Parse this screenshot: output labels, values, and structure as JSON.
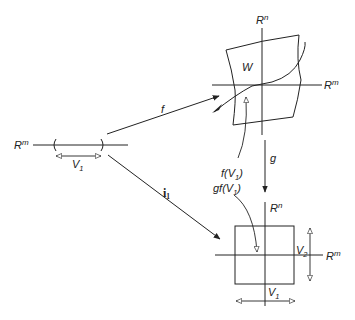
{
  "diagram": {
    "source_line": {
      "axis_label": "R",
      "axis_sup": "m",
      "interval_label": "V",
      "interval_sub": "1"
    },
    "top_chart": {
      "vertical_axis_label": "R",
      "vertical_axis_sup": "n",
      "horizontal_axis_label": "R",
      "horizontal_axis_sup": "m",
      "region_label": "W"
    },
    "bottom_chart": {
      "vertical_axis_label": "R",
      "vertical_axis_sup": "n",
      "horizontal_axis_label": "R",
      "horizontal_axis_sup": "m",
      "v2_label": "V",
      "v2_sub": "2",
      "v1_label": "V",
      "v1_sub": "1"
    },
    "maps": {
      "f_label": "f",
      "g_label": "g",
      "i_label": "i",
      "i_sub": "1"
    },
    "annotations": {
      "f_of_v1_prefix": "f(V",
      "f_of_v1_sub": "1",
      "f_of_v1_suffix": ")",
      "gf_of_v1_prefix": "gf(V",
      "gf_of_v1_sub": "1",
      "gf_of_v1_suffix": ")"
    },
    "colors": {
      "stroke": "#222222",
      "background": "#ffffff"
    }
  }
}
